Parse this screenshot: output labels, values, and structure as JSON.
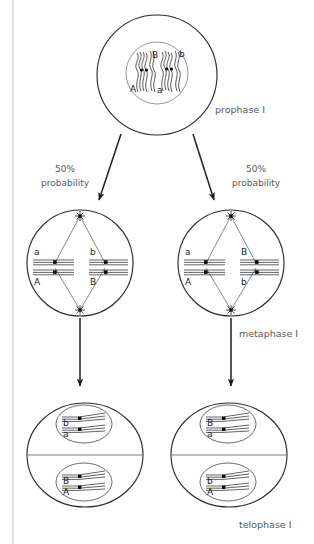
{
  "diagram": {
    "title_cutoff": "",
    "stage_labels": [
      {
        "id": "prophase",
        "text": "prophase I"
      },
      {
        "id": "metaphase",
        "text": "metaphase I"
      },
      {
        "id": "telophase",
        "text": "telophase I"
      }
    ],
    "probabilities": [
      {
        "id": "left",
        "line1": "50%",
        "line2": "probability"
      },
      {
        "id": "right",
        "line1": "50%",
        "line2": "probability"
      }
    ],
    "prophase_cell": {
      "alleles": {
        "upper_left": "B",
        "upper_right": "b",
        "lower_left": "A",
        "lower_right": "a"
      }
    },
    "metaphase_cells": [
      {
        "id": "left",
        "alleles": {
          "left_top": "a",
          "left_bottom": "A",
          "right_top": "b",
          "right_bottom": "B"
        }
      },
      {
        "id": "right",
        "alleles": {
          "left_top": "a",
          "left_bottom": "A",
          "right_top": "B",
          "right_bottom": "b"
        }
      }
    ],
    "telophase_cells": [
      {
        "id": "left",
        "top_nucleus": {
          "upper": "b",
          "lower": "a"
        },
        "bottom_nucleus": {
          "upper": "B",
          "lower": "A"
        }
      },
      {
        "id": "right",
        "top_nucleus": {
          "upper": "B",
          "lower": "a"
        },
        "bottom_nucleus": {
          "upper": "b",
          "lower": "A"
        }
      }
    ],
    "colors": {
      "stroke": "#2b2b2b",
      "label": "#58595b",
      "border": "#cfcfcf",
      "background": "#ffffff"
    }
  }
}
